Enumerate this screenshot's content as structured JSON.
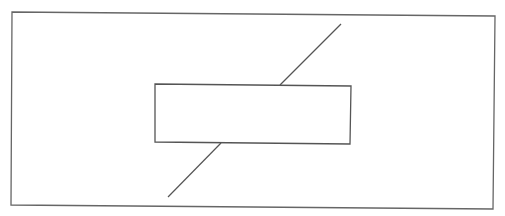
{
  "diagram": {
    "stroke_color": "#666666",
    "background": "#ffffff",
    "outer_frame": {
      "points": "12,12 495,16 493,209 11,205"
    },
    "inner_box": {
      "points": "155,84 351,86 350,144 155,142"
    },
    "diagonal_line": {
      "upper_segment": {
        "x1": 341,
        "y1": 24,
        "x2": 280,
        "y2": 85
      },
      "lower_segment": {
        "x1": 221,
        "y1": 143,
        "x2": 168,
        "y2": 197
      }
    }
  }
}
